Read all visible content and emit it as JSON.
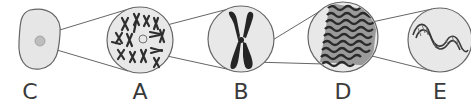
{
  "diagram": {
    "colors": {
      "stroke": "#555555",
      "fill": "#e4e4e4",
      "dark": "#2a2a2a",
      "label": "#3a3a3a"
    },
    "panels": [
      {
        "id": "C",
        "label": "C",
        "content": "cell-with-nucleus",
        "x": 30
      },
      {
        "id": "A",
        "label": "A",
        "content": "chromosomes-cluster",
        "x": 140
      },
      {
        "id": "B",
        "label": "B",
        "content": "single-chromosome",
        "x": 241
      },
      {
        "id": "D",
        "label": "D",
        "content": "coiled-chromatin",
        "x": 343
      },
      {
        "id": "E",
        "label": "E",
        "content": "dna-double-helix",
        "x": 440
      }
    ]
  }
}
